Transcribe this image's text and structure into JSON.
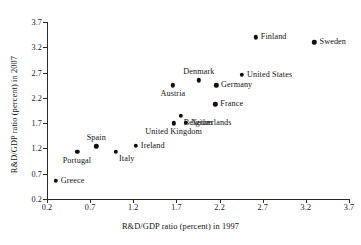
{
  "chart_data": {
    "type": "scatter",
    "title": "",
    "xlabel": "R&D/GDP ratio (percent) in 1997",
    "ylabel": "R&D/GDP ratio (percent) in 2007",
    "xlim": [
      0.2,
      3.7
    ],
    "ylim": [
      0.2,
      3.7
    ],
    "xticks": [
      "0.2",
      "0.7",
      "1.2",
      "1.7",
      "2.2",
      "2.7",
      "3.2",
      "3.7"
    ],
    "yticks": [
      "0.2",
      "0.7",
      "1.2",
      "1.7",
      "2.2",
      "2.7",
      "3.2",
      "3.7"
    ],
    "grid": false,
    "legend": "none",
    "marker_color": "#101010",
    "axis_color": "#2b2b2b",
    "points": [
      {
        "label": "Greece",
        "x": 0.3,
        "y": 0.56,
        "label_pos": "right"
      },
      {
        "label": "Portugal",
        "x": 0.55,
        "y": 1.13,
        "label_pos": "below"
      },
      {
        "label": "Spain",
        "x": 0.77,
        "y": 1.24,
        "label_pos": "above"
      },
      {
        "label": "Italy",
        "x": 1.0,
        "y": 1.13,
        "label_pos": "below-right"
      },
      {
        "label": "Ireland",
        "x": 1.23,
        "y": 1.25,
        "label_pos": "right"
      },
      {
        "label": "United Kingdom",
        "x": 1.67,
        "y": 1.7,
        "label_pos": "below"
      },
      {
        "label": "Netherlands",
        "x": 1.81,
        "y": 1.71,
        "label_pos": "right"
      },
      {
        "label": "Belgium",
        "x": 1.75,
        "y": 1.84,
        "label_pos": "below-right"
      },
      {
        "label": "France",
        "x": 2.15,
        "y": 2.07,
        "label_pos": "right"
      },
      {
        "label": "Austria",
        "x": 1.66,
        "y": 2.45,
        "label_pos": "below"
      },
      {
        "label": "Denmark",
        "x": 1.96,
        "y": 2.55,
        "label_pos": "above"
      },
      {
        "label": "Germany",
        "x": 2.16,
        "y": 2.45,
        "label_pos": "right"
      },
      {
        "label": "United States",
        "x": 2.46,
        "y": 2.66,
        "label_pos": "right"
      },
      {
        "label": "Finland",
        "x": 2.62,
        "y": 3.4,
        "label_pos": "right"
      },
      {
        "label": "Sweden",
        "x": 3.3,
        "y": 3.3,
        "label_pos": "right"
      }
    ]
  }
}
